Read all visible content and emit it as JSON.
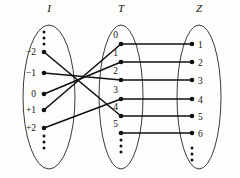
{
  "diagram": {
    "type": "mapping-diagram",
    "stroke_color": "#111111",
    "ellipse_color": "#3a3a3a",
    "background_color": "#fdfdfb"
  },
  "sets": [
    {
      "id": "I",
      "label": "I",
      "label_x": 49,
      "label_y": 12,
      "center_x": 49,
      "center_y": 97,
      "rx": 26,
      "ry": 72,
      "top_ellipsis": {
        "x": 44,
        "y_values": [
          32,
          38,
          44
        ]
      },
      "bottom_ellipsis": {
        "x": 44,
        "y_values": [
          136,
          142,
          148
        ]
      },
      "nodes": [
        {
          "id": "I-m2",
          "label": "−2",
          "x": 44,
          "y": 52,
          "label_x": 36,
          "label_y": 55,
          "label_anchor": "end"
        },
        {
          "id": "I-m1",
          "label": "−1",
          "x": 44,
          "y": 73,
          "label_x": 36,
          "label_y": 76,
          "label_anchor": "end"
        },
        {
          "id": "I-0",
          "label": "0",
          "x": 44,
          "y": 94,
          "label_x": 36,
          "label_y": 97,
          "label_anchor": "end"
        },
        {
          "id": "I-p1",
          "label": "+1",
          "x": 44,
          "y": 110,
          "label_x": 36,
          "label_y": 113,
          "label_anchor": "end"
        },
        {
          "id": "I-p2",
          "label": "+2",
          "x": 44,
          "y": 128,
          "label_x": 36,
          "label_y": 131,
          "label_anchor": "end"
        }
      ]
    },
    {
      "id": "T",
      "label": "T",
      "label_x": 121,
      "label_y": 12,
      "center_x": 121,
      "center_y": 97,
      "rx": 22,
      "ry": 72,
      "top_ellipsis": null,
      "bottom_ellipsis": {
        "x": 121,
        "y_values": [
          140,
          146,
          152
        ]
      },
      "nodes": [
        {
          "id": "T-0",
          "label": "0",
          "x": 121,
          "y": 44,
          "label_x": 118,
          "label_y": 38,
          "label_anchor": "end"
        },
        {
          "id": "T-1",
          "label": "1",
          "x": 121,
          "y": 62,
          "label_x": 118,
          "label_y": 56,
          "label_anchor": "end"
        },
        {
          "id": "T-2",
          "label": "2",
          "x": 121,
          "y": 80,
          "label_x": 118,
          "label_y": 74,
          "label_anchor": "end"
        },
        {
          "id": "T-3",
          "label": "3",
          "x": 121,
          "y": 99,
          "label_x": 118,
          "label_y": 93,
          "label_anchor": "end"
        },
        {
          "id": "T-4",
          "label": "4",
          "x": 121,
          "y": 116,
          "label_x": 118,
          "label_y": 110,
          "label_anchor": "end"
        },
        {
          "id": "T-5",
          "label": "5",
          "x": 121,
          "y": 133,
          "label_x": 118,
          "label_y": 127,
          "label_anchor": "end"
        }
      ]
    },
    {
      "id": "Z",
      "label": "Z",
      "label_x": 199,
      "label_y": 12,
      "center_x": 199,
      "center_y": 97,
      "rx": 22,
      "ry": 72,
      "top_ellipsis": null,
      "bottom_ellipsis": {
        "x": 192,
        "y_values": [
          148,
          154,
          160
        ]
      },
      "nodes": [
        {
          "id": "Z-1",
          "label": "1",
          "x": 192,
          "y": 44,
          "label_x": 198,
          "label_y": 48,
          "label_anchor": "start"
        },
        {
          "id": "Z-2",
          "label": "2",
          "x": 192,
          "y": 62,
          "label_x": 198,
          "label_y": 66,
          "label_anchor": "start"
        },
        {
          "id": "Z-3",
          "label": "3",
          "x": 192,
          "y": 80,
          "label_x": 198,
          "label_y": 84,
          "label_anchor": "start"
        },
        {
          "id": "Z-4",
          "label": "4",
          "x": 192,
          "y": 99,
          "label_x": 198,
          "label_y": 103,
          "label_anchor": "start"
        },
        {
          "id": "Z-5",
          "label": "5",
          "x": 192,
          "y": 116,
          "label_x": 198,
          "label_y": 120,
          "label_anchor": "start"
        },
        {
          "id": "Z-6",
          "label": "6",
          "x": 192,
          "y": 133,
          "label_x": 198,
          "label_y": 137,
          "label_anchor": "start"
        }
      ]
    }
  ],
  "edges": [
    {
      "id": "e-i-m2-t4",
      "from": "I-m2",
      "to": "T-4",
      "x1": 44,
      "y1": 52,
      "x2": 121,
      "y2": 116
    },
    {
      "id": "e-i-m1-t2",
      "from": "I-m1",
      "to": "T-2",
      "x1": 44,
      "y1": 73,
      "x2": 121,
      "y2": 80
    },
    {
      "id": "e-i-0-t1",
      "from": "I-0",
      "to": "T-1",
      "x1": 44,
      "y1": 94,
      "x2": 121,
      "y2": 62
    },
    {
      "id": "e-i-p1-t0",
      "from": "I-p1",
      "to": "T-0",
      "x1": 44,
      "y1": 110,
      "x2": 121,
      "y2": 44
    },
    {
      "id": "e-i-p2-t3",
      "from": "I-p2",
      "to": "T-3",
      "x1": 44,
      "y1": 128,
      "x2": 121,
      "y2": 99
    },
    {
      "id": "e-t0-z1",
      "from": "T-0",
      "to": "Z-1",
      "x1": 121,
      "y1": 44,
      "x2": 192,
      "y2": 44
    },
    {
      "id": "e-t1-z2",
      "from": "T-1",
      "to": "Z-2",
      "x1": 121,
      "y1": 62,
      "x2": 192,
      "y2": 62
    },
    {
      "id": "e-t2-z3",
      "from": "T-2",
      "to": "Z-3",
      "x1": 121,
      "y1": 80,
      "x2": 192,
      "y2": 80
    },
    {
      "id": "e-t3-z4",
      "from": "T-3",
      "to": "Z-4",
      "x1": 121,
      "y1": 99,
      "x2": 192,
      "y2": 99
    },
    {
      "id": "e-t4-z5",
      "from": "T-4",
      "to": "Z-5",
      "x1": 121,
      "y1": 116,
      "x2": 192,
      "y2": 116
    },
    {
      "id": "e-t5-z6",
      "from": "T-5",
      "to": "Z-6",
      "x1": 121,
      "y1": 133,
      "x2": 192,
      "y2": 133
    }
  ]
}
